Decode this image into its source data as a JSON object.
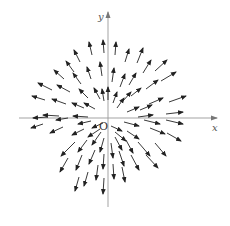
{
  "figure": {
    "title": "",
    "origin_label": "O",
    "x_axis_label": "x",
    "y_axis_label": "y",
    "colors": {
      "background": "#ffffff",
      "axis": "#888888",
      "arrow": "#222222"
    },
    "origin_px": [
      108,
      118
    ],
    "x_axis_px": [
      19,
      217
    ],
    "y_axis_px": [
      12,
      207
    ],
    "arrows": [
      [
        115,
        55,
        116,
        42
      ],
      [
        125,
        62,
        129,
        49
      ],
      [
        137,
        63,
        143,
        48
      ],
      [
        112,
        82,
        114,
        68
      ],
      [
        120,
        87,
        125,
        74
      ],
      [
        129,
        85,
        136,
        73
      ],
      [
        143,
        73,
        151,
        60
      ],
      [
        155,
        71,
        167,
        60
      ],
      [
        108,
        100,
        108,
        87
      ],
      [
        113,
        103,
        117,
        92
      ],
      [
        117,
        108,
        124,
        98
      ],
      [
        123,
        101,
        131,
        92
      ],
      [
        131,
        96,
        141,
        88
      ],
      [
        146,
        89,
        158,
        80
      ],
      [
        161,
        81,
        176,
        72
      ],
      [
        127,
        112,
        139,
        107
      ],
      [
        140,
        110,
        152,
        105
      ],
      [
        149,
        104,
        163,
        98
      ],
      [
        169,
        102,
        186,
        96
      ],
      [
        138,
        117,
        153,
        115
      ],
      [
        166,
        114,
        183,
        112
      ],
      [
        104,
        53,
        103,
        40
      ],
      [
        92,
        55,
        89,
        42
      ],
      [
        80,
        62,
        74,
        50
      ],
      [
        74,
        72,
        66,
        61
      ],
      [
        102,
        76,
        100,
        62
      ],
      [
        91,
        79,
        87,
        67
      ],
      [
        81,
        84,
        73,
        73
      ],
      [
        64,
        79,
        54,
        70
      ],
      [
        104,
        101,
        102,
        89
      ],
      [
        100,
        99,
        94,
        88
      ],
      [
        88,
        98,
        79,
        89
      ],
      [
        70,
        92,
        57,
        85
      ],
      [
        52,
        90,
        38,
        83
      ],
      [
        95,
        109,
        84,
        103
      ],
      [
        84,
        108,
        72,
        103
      ],
      [
        66,
        104,
        52,
        99
      ],
      [
        45,
        100,
        32,
        96
      ],
      [
        88,
        117,
        73,
        116
      ],
      [
        59,
        116,
        43,
        115
      ],
      [
        103,
        123,
        92,
        128
      ],
      [
        91,
        121,
        78,
        124
      ],
      [
        68,
        118,
        56,
        120
      ],
      [
        48,
        117,
        33,
        118
      ],
      [
        100,
        129,
        88,
        137
      ],
      [
        84,
        129,
        72,
        135
      ],
      [
        63,
        127,
        50,
        133
      ],
      [
        43,
        124,
        31,
        128
      ],
      [
        101,
        132,
        92,
        145
      ],
      [
        87,
        140,
        78,
        152
      ],
      [
        75,
        142,
        61,
        156
      ],
      [
        104,
        138,
        100,
        152
      ],
      [
        95,
        150,
        89,
        164
      ],
      [
        82,
        155,
        76,
        170
      ],
      [
        68,
        158,
        60,
        172
      ],
      [
        104,
        154,
        103,
        169
      ],
      [
        98,
        165,
        96,
        180
      ],
      [
        88,
        172,
        84,
        186
      ],
      [
        79,
        177,
        75,
        191
      ],
      [
        104,
        178,
        103,
        194
      ],
      [
        111,
        126,
        122,
        131
      ],
      [
        124,
        122,
        139,
        126
      ],
      [
        144,
        120,
        160,
        124
      ],
      [
        166,
        120,
        183,
        124
      ],
      [
        115,
        132,
        126,
        141
      ],
      [
        127,
        131,
        139,
        139
      ],
      [
        150,
        128,
        165,
        134
      ],
      [
        167,
        133,
        181,
        141
      ],
      [
        115,
        137,
        122,
        150
      ],
      [
        126,
        140,
        133,
        153
      ],
      [
        138,
        142,
        150,
        156
      ],
      [
        155,
        143,
        166,
        156
      ],
      [
        111,
        143,
        113,
        158
      ],
      [
        119,
        151,
        124,
        166
      ],
      [
        131,
        155,
        139,
        170
      ],
      [
        146,
        155,
        158,
        168
      ],
      [
        113,
        164,
        114,
        179
      ],
      [
        122,
        167,
        125,
        182
      ]
    ]
  }
}
